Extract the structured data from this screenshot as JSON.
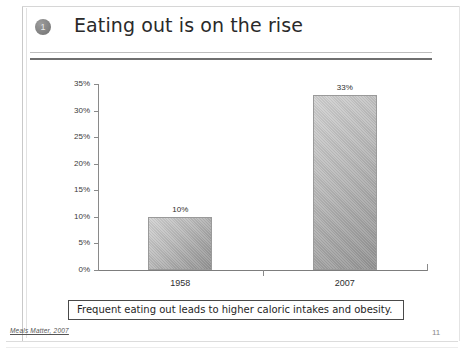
{
  "slide": {
    "bullet_number": "1",
    "title": "Eating out is on the rise",
    "caption": "Frequent eating out leads to higher caloric intakes and obesity.",
    "source_note": "Meals Matter, 2007",
    "page_number": "11"
  },
  "chart_data": {
    "type": "bar",
    "title": "",
    "subtitle": "",
    "xlabel": "",
    "ylabel": "",
    "categories": [
      "1958",
      "2007"
    ],
    "values": [
      10,
      33
    ],
    "value_labels": [
      "10%",
      "33%"
    ],
    "ylim": [
      0,
      35
    ],
    "ytick_values": [
      0,
      5,
      10,
      15,
      20,
      25,
      30,
      35
    ],
    "ytick_labels": [
      "0%",
      "5%",
      "10%",
      "15%",
      "20%",
      "25%",
      "30%",
      "35%"
    ],
    "grid": false,
    "legend": false,
    "legend_position": "none",
    "series": [
      {
        "name": "Percent of food dollars spent eating out",
        "values": [
          10,
          33
        ]
      }
    ],
    "bar_color": "#b4b4b4",
    "bar_border_color": "#9a9a9a",
    "axis_color": "#8a8a8a"
  }
}
